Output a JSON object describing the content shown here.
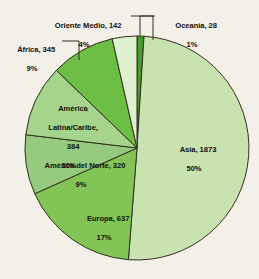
{
  "chart_data": {
    "type": "pie",
    "title": "",
    "subtitle": "",
    "xlabel": "",
    "ylabel": "",
    "legend_position": "none",
    "grid": false,
    "total": 3729,
    "units": "millones",
    "labels": [
      "Asia",
      "Europa",
      "América Latina/Caribe",
      "África",
      "América del Norte",
      "Oriente Medio",
      "Oceanía"
    ],
    "values": [
      1873,
      637,
      384,
      345,
      320,
      142,
      28
    ],
    "percents": [
      50,
      17,
      10,
      9,
      9,
      4,
      1
    ],
    "colors": [
      "#c9e3b0",
      "#82c556",
      "#a5d48d",
      "#6cbe45",
      "#95cb7e",
      "#dff0d0",
      "#4a9b2e"
    ],
    "slices": [
      {
        "name": "Oceania",
        "label": "Oceanía, 28",
        "value": 28,
        "percent_text": "1%",
        "percent": 1,
        "color": "#4a9b2e",
        "start_deg": 0,
        "end_deg": 3.6
      },
      {
        "name": "Asia",
        "label": "Asia, 1873",
        "value": 1873,
        "percent_text": "50%",
        "percent": 50,
        "color": "#c9e3b0",
        "start_deg": 3.6,
        "end_deg": 184.4
      },
      {
        "name": "Europa",
        "label": "Europa, 637",
        "value": 637,
        "percent_text": "17%",
        "percent": 17,
        "color": "#82c556",
        "start_deg": 184.4,
        "end_deg": 245.9
      },
      {
        "name": "America del Norte",
        "label": "América del Norte, 320",
        "value": 320,
        "percent_text": "9%",
        "percent": 9,
        "color": "#95cb7e",
        "start_deg": 245.9,
        "end_deg": 276.8
      },
      {
        "name": "America Latina/Caribe",
        "label": "América\nLatina/Caribe,\n384",
        "value": 384,
        "percent_text": "10%",
        "percent": 10,
        "color": "#a5d48d",
        "start_deg": 276.8,
        "end_deg": 313.9
      },
      {
        "name": "Africa",
        "label": "África, 345",
        "value": 345,
        "percent_text": "9%",
        "percent": 9,
        "color": "#6cbe45",
        "start_deg": 313.9,
        "end_deg": 347.2
      },
      {
        "name": "Oriente Medio",
        "label": "Oriente Medio, 142",
        "value": 142,
        "percent_text": "4%",
        "percent": 4,
        "color": "#dff0d0",
        "start_deg": 347.2,
        "end_deg": 360
      }
    ]
  },
  "labels": {
    "asia": {
      "text": "Asia, 1873",
      "pct": "50%"
    },
    "europa": {
      "text": "Europa, 637",
      "pct": "17%"
    },
    "alatina": {
      "line1": "América",
      "line2": "Latina/Caribe,",
      "line3": "384",
      "pct": "10%"
    },
    "africa": {
      "text": "África, 345",
      "pct": "9%"
    },
    "anorte": {
      "text": "América del Norte, 320",
      "pct": "9%"
    },
    "oriente": {
      "text": "Oriente Medio, 142",
      "pct": "4%"
    },
    "oceania": {
      "text": "Oceanía, 28",
      "pct": "1%"
    }
  },
  "style": {
    "background": "#f2f0e8",
    "stroke": "#33301f",
    "text_color": "#12100c"
  }
}
